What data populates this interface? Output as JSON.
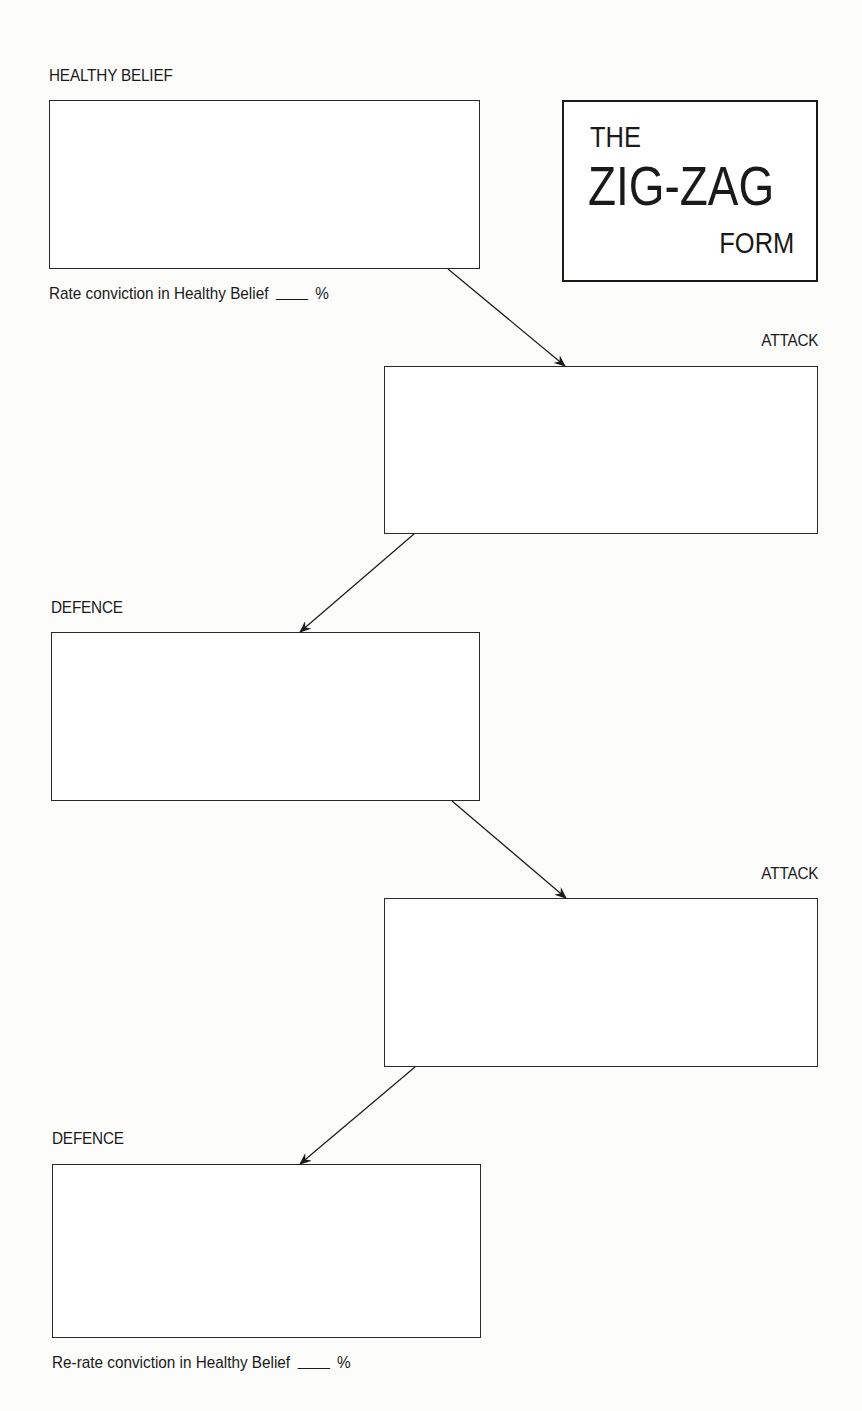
{
  "title_box": {
    "line1": "THE",
    "line2": "ZIG-ZAG",
    "line3": "FORM"
  },
  "sections": [
    {
      "label": "HEALTHY BELIEF",
      "kind": "belief"
    },
    {
      "label": "ATTACK",
      "kind": "attack"
    },
    {
      "label": "DEFENCE",
      "kind": "defence"
    },
    {
      "label": "ATTACK",
      "kind": "attack"
    },
    {
      "label": "DEFENCE",
      "kind": "defence"
    }
  ],
  "rate_caption": {
    "text": "Rate conviction in Healthy Belief",
    "unit": "%"
  },
  "rerate_caption": {
    "text": "Re-rate conviction in Healthy Belief",
    "unit": "%"
  }
}
